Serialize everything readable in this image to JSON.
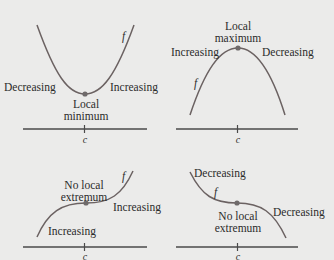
{
  "colors": {
    "background": "#ebebea",
    "curve": "#6b6262",
    "axis": "#4a4a4a",
    "point": "#6e6a6a",
    "text": "#2b2b2b"
  },
  "panels": [
    {
      "id": "local-minimum",
      "function_label": "f",
      "axis_label": "c",
      "point_label_line1": "Local",
      "point_label_line2": "minimum",
      "left_label": "Decreasing",
      "right_label": "Increasing"
    },
    {
      "id": "local-maximum",
      "function_label": "f",
      "axis_label": "c",
      "point_label_line1": "Local",
      "point_label_line2": "maximum",
      "left_label": "Increasing",
      "right_label": "Decreasing"
    },
    {
      "id": "no-extremum-increasing",
      "function_label": "f",
      "axis_label": "c",
      "point_label_line1": "No local",
      "point_label_line2": "extremum",
      "left_label": "Increasing",
      "right_label": "Increasing"
    },
    {
      "id": "no-extremum-decreasing",
      "function_label": "f",
      "axis_label": "c",
      "point_label_line1": "No local",
      "point_label_line2": "extremum",
      "left_label": "Decreasing",
      "right_label": "Decreasing"
    }
  ]
}
